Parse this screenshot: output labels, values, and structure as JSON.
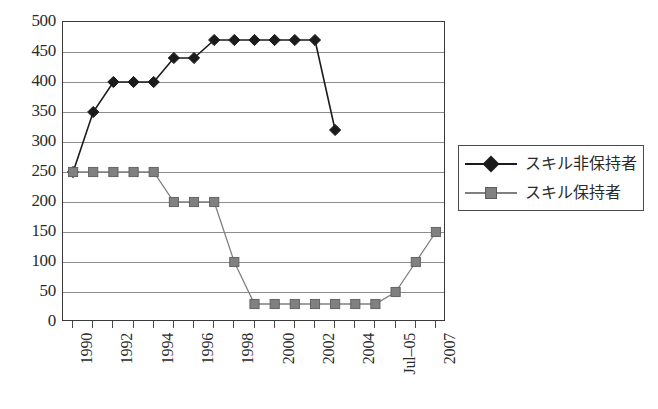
{
  "chart_data": {
    "type": "line",
    "title": "",
    "subtitle": "",
    "xlabel": "",
    "ylabel": "",
    "ylim": [
      0,
      500
    ],
    "ytick_step": 50,
    "yticks": [
      500,
      450,
      400,
      350,
      300,
      250,
      200,
      150,
      100,
      50,
      0
    ],
    "grid": true,
    "legend_position": "right",
    "x": [
      "1990",
      "1991",
      "1992",
      "1993",
      "1994",
      "1995",
      "1996",
      "1997",
      "1998",
      "1999",
      "2000",
      "2001",
      "2002",
      "2003",
      "2004",
      "2005",
      "Jul-05",
      "2006",
      "2007"
    ],
    "xtick_labels_visible": [
      "1990",
      "1992",
      "1994",
      "1996",
      "1998",
      "2000",
      "2002",
      "2004",
      "Jul-05",
      "2007"
    ],
    "series": [
      {
        "name": "スキル非保持者",
        "marker": "diamond",
        "color": "#1b1b1b",
        "values": [
          250,
          350,
          400,
          400,
          400,
          440,
          440,
          470,
          470,
          470,
          470,
          470,
          470,
          320,
          null,
          null,
          null,
          null,
          null
        ]
      },
      {
        "name": "スキル保持者",
        "marker": "square",
        "color": "#808080",
        "values": [
          250,
          250,
          250,
          250,
          250,
          200,
          200,
          200,
          100,
          30,
          30,
          30,
          30,
          30,
          30,
          30,
          50,
          100,
          150
        ]
      }
    ]
  },
  "legend": {
    "entries": [
      {
        "label": "スキル非保持者",
        "marker": "diamond"
      },
      {
        "label": "スキル保持者",
        "marker": "square"
      }
    ]
  },
  "colors": {
    "series_diamond": "#1b1b1b",
    "series_square": "#808080",
    "gridline": "#8d8d8d",
    "frame": "#3a3a3a",
    "text": "#2b2b2b",
    "background": "#ffffff"
  }
}
